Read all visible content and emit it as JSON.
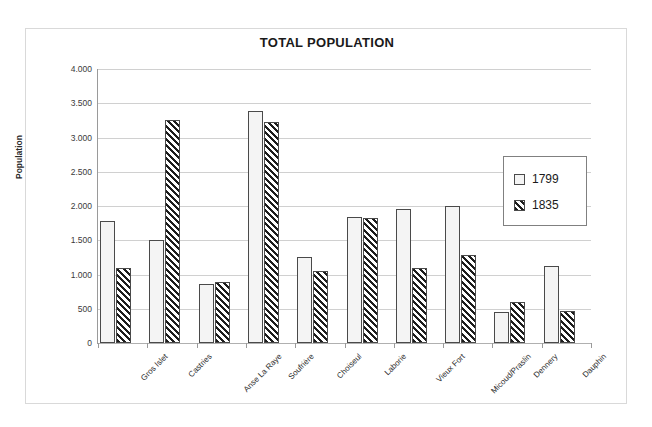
{
  "chart_data": {
    "type": "bar",
    "title": "TOTAL POPULATION",
    "xlabel": "",
    "ylabel": "Population",
    "ylim": [
      0,
      4000
    ],
    "ytick_values": [
      0,
      500,
      1000,
      1500,
      2000,
      2500,
      3000,
      3500,
      4000
    ],
    "ytick_labels": [
      "0",
      "500",
      "1.000",
      "1.500",
      "2.000",
      "2.500",
      "3.000",
      "3.500",
      "4.000"
    ],
    "grid": true,
    "legend_position": "right-inside",
    "categories": [
      "Gros Islet",
      "Castries",
      "Anse La Raye",
      "Soufrière",
      "Choiseul",
      "Laborie",
      "Vieux Fort",
      "Micoud/Praslin",
      "Dennery",
      "Dauphin"
    ],
    "series": [
      {
        "name": "1799",
        "pattern": "dotted",
        "values": [
          1780,
          1500,
          855,
          3390,
          1260,
          1840,
          1950,
          2000,
          450,
          1120
        ]
      },
      {
        "name": "1835",
        "pattern": "diagonal-hatch",
        "values": [
          1100,
          3250,
          885,
          3220,
          1050,
          1820,
          1100,
          1290,
          600,
          470
        ]
      }
    ]
  },
  "legend": {
    "entries": [
      {
        "label": "1799"
      },
      {
        "label": "1835"
      }
    ]
  },
  "colors": {
    "frame_border": "#d9d9d9",
    "gridline": "#d0d0d0",
    "axis_line": "#9a9a9a",
    "bar_outline": "#4a4a4a",
    "series_1799_fill": "#f4f4f4",
    "series_1835_fill": "#1d1d1d",
    "text": "#1a1a1a"
  }
}
